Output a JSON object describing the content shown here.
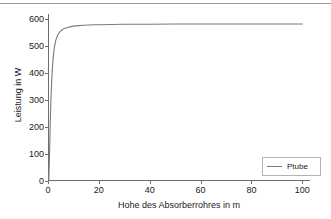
{
  "chart_data": {
    "type": "line",
    "title": "",
    "xlabel": "Hohe des Absorberrohres in m",
    "ylabel": "Leistung in W",
    "xlim": [
      0,
      103
    ],
    "ylim": [
      0,
      620
    ],
    "grid": false,
    "legend_position": "lower right",
    "xticks": [
      0,
      20,
      40,
      60,
      80,
      100
    ],
    "xtick_labels": [
      "0",
      "20",
      "40",
      "60",
      "80",
      "100"
    ],
    "yticks": [
      0,
      100,
      200,
      300,
      400,
      500,
      600
    ],
    "ytick_labels": [
      "0",
      "100",
      "200",
      "300",
      "400",
      "500",
      "600"
    ],
    "series": [
      {
        "name": "Ptube",
        "color": "#7a7a7a",
        "x": [
          0.3,
          0.5,
          0.8,
          1.0,
          1.3,
          1.6,
          2.0,
          2.5,
          3.0,
          3.5,
          4.0,
          4.5,
          5.0,
          6.0,
          7.0,
          8.0,
          9.0,
          10.0,
          12.0,
          14.0,
          16.0,
          18.0,
          20.0,
          25.0,
          30.0,
          35.0,
          40.0,
          50.0,
          60.0,
          70.0,
          80.0,
          90.0,
          100.0
        ],
        "y": [
          0,
          60,
          180,
          255,
          340,
          400,
          455,
          496,
          520,
          535,
          545,
          552,
          557,
          564,
          568,
          571,
          573,
          575,
          577,
          578,
          579,
          580,
          580,
          581,
          582,
          582,
          582,
          583,
          583,
          583,
          583,
          583,
          583
        ]
      }
    ]
  },
  "legend": {
    "entries": [
      {
        "label": "Ptube",
        "color": "#7a7a7a"
      }
    ]
  },
  "colors": {
    "curve": "#7a7a7a",
    "axis": "#6e6e6e",
    "text": "#1a1a1a",
    "legend_border": "#b4b4b4",
    "top_rule": "#9a9a9a",
    "background": "#ffffff"
  }
}
